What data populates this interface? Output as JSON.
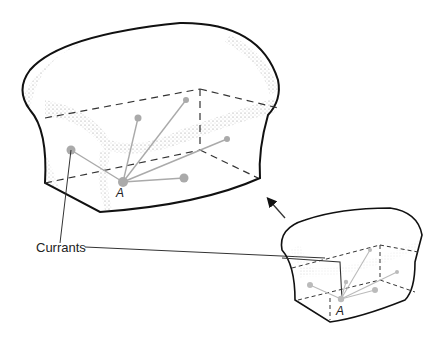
{
  "labels": {
    "currants": "Currants",
    "point_large": "A",
    "point_small": "A"
  },
  "colors": {
    "outline": "#111111",
    "crumb": "#888888",
    "currant": "#aaaaaa",
    "dashed": "#333333"
  },
  "figure": {
    "large_loaf": {
      "point": "A",
      "currant_count": 5
    },
    "small_loaf": {
      "point": "A",
      "currant_count": 5
    },
    "arrow": "expansion-direction"
  }
}
